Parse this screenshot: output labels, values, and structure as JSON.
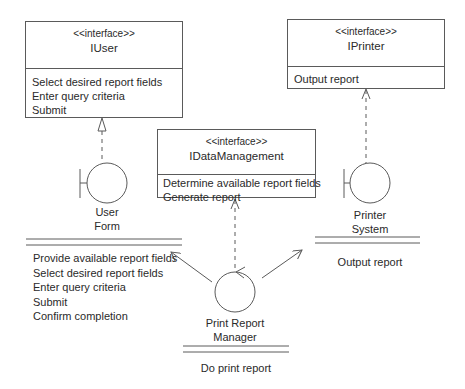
{
  "interfaces": {
    "iuser": {
      "stereotype": "<<interface>>",
      "name": "IUser",
      "operations": [
        "Select desired report fields",
        "Enter query criteria",
        "Submit"
      ]
    },
    "iprinter": {
      "stereotype": "<<interface>>",
      "name": "IPrinter",
      "operations": [
        "Output report"
      ]
    },
    "idatamanagement": {
      "stereotype": "<<interface>>",
      "name": "IDataManagement",
      "operations": [
        "Determine available report fields",
        "Generate report"
      ]
    }
  },
  "objects": {
    "user_form": {
      "type": "boundary",
      "name_line1": "User",
      "name_line2": "Form",
      "operations": [
        "Provide available report fields",
        "Select desired report fields",
        "Enter query criteria",
        "Submit",
        "Confirm completion"
      ]
    },
    "printer_system": {
      "type": "boundary",
      "name_line1": "Printer",
      "name_line2": "System",
      "operations": [
        "Output report"
      ]
    },
    "print_report_manager": {
      "type": "control",
      "name_line1": "Print Report",
      "name_line2": "Manager",
      "operations": [
        "Do print report"
      ]
    }
  },
  "relations": [
    {
      "from": "User Form",
      "to": "IUser",
      "kind": "realization"
    },
    {
      "from": "Printer System",
      "to": "IPrinter",
      "kind": "dependency"
    },
    {
      "from": "Print Report Manager",
      "to": "IDataManagement",
      "kind": "dependency"
    },
    {
      "from": "Print Report Manager",
      "to": "User Form",
      "kind": "association"
    },
    {
      "from": "Print Report Manager",
      "to": "Printer System",
      "kind": "association"
    }
  ],
  "colors": {
    "line": "#5a5a5a",
    "text": "#2a2a2a",
    "background": "#ffffff"
  }
}
